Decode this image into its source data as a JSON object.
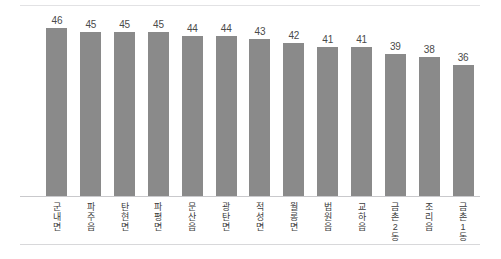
{
  "chart_data": {
    "type": "bar",
    "title": "",
    "subtitle": "",
    "xlabel": "",
    "ylabel": "",
    "categories": [
      "군내면",
      "파주읍",
      "탄현면",
      "파평면",
      "문산읍",
      "광탄면",
      "적성면",
      "월롱면",
      "법원읍",
      "교하읍",
      "금촌2동",
      "조리읍",
      "금촌1동"
    ],
    "values": [
      46,
      45,
      45,
      45,
      44,
      44,
      43,
      42,
      41,
      41,
      39,
      38,
      36
    ],
    "ylim": [
      0,
      48
    ],
    "grid": false,
    "legend": null,
    "data_labels": true,
    "bar_color": "#8a8a8a",
    "axis_color": "#c9c9cc",
    "label_color": "#4a4a4a"
  }
}
